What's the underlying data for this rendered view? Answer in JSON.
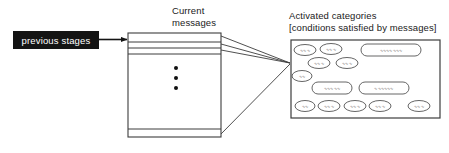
{
  "diagram": {
    "title_current_messages": "Current\nmessages",
    "current_messages_line1": "Current",
    "current_messages_line2": "messages",
    "activated_line1": "Activated categories",
    "activated_line2": "[conditions satisfied by messages]",
    "previous_stages_label": "previous stages",
    "ellipsis_label": "vertical-ellipsis",
    "colors": {
      "ink": "#1a1a1a",
      "stroke": "#3c3c3c",
      "black_box_fill": "#141414",
      "black_box_text": "#ffffff",
      "scribble": "#6a6a6a",
      "background": "#ffffff"
    },
    "message_rows": [
      {
        "id": "row-1",
        "y": 33,
        "height": 9
      },
      {
        "id": "row-2",
        "y": 42,
        "height": 6
      },
      {
        "id": "row-3",
        "y": 48,
        "height": 6
      },
      {
        "id": "row-body",
        "y": 54,
        "height": 75
      },
      {
        "id": "row-last",
        "y": 129,
        "height": 8
      }
    ],
    "categories": [
      {
        "id": "cat-1",
        "cx": 305,
        "cy": 50,
        "rx": 11,
        "ry": 5.5,
        "text": "∿∿∿"
      },
      {
        "id": "cat-2",
        "cx": 331,
        "cy": 49,
        "rx": 11,
        "ry": 5.5,
        "text": "∿∿∿"
      },
      {
        "id": "cat-3",
        "cx": 391,
        "cy": 50,
        "rx": 30,
        "ry": 6,
        "text": "∿∿∿∿∿∿∿"
      },
      {
        "id": "cat-4",
        "cx": 319,
        "cy": 63,
        "rx": 11,
        "ry": 5.5,
        "text": "∿∿∿"
      },
      {
        "id": "cat-5",
        "cx": 347,
        "cy": 63,
        "rx": 11,
        "ry": 5.5,
        "text": "∿∿∿"
      },
      {
        "id": "cat-6",
        "cx": 302,
        "cy": 76,
        "rx": 10,
        "ry": 5.5,
        "text": "∿∿"
      },
      {
        "id": "cat-7",
        "cx": 332,
        "cy": 88,
        "rx": 20,
        "ry": 6,
        "text": "∿∿∿∿∿"
      },
      {
        "id": "cat-8",
        "cx": 384,
        "cy": 88,
        "rx": 25,
        "ry": 6,
        "text": "∿∿∿∿∿∿"
      },
      {
        "id": "cat-9",
        "cx": 305,
        "cy": 106,
        "rx": 10,
        "ry": 5.5,
        "text": "∿∿"
      },
      {
        "id": "cat-10",
        "cx": 329,
        "cy": 106,
        "rx": 11,
        "ry": 5.5,
        "text": "∿∿∿"
      },
      {
        "id": "cat-11",
        "cx": 355,
        "cy": 106,
        "rx": 11,
        "ry": 5.5,
        "text": "∿∿∿"
      },
      {
        "id": "cat-12",
        "cx": 380,
        "cy": 106,
        "rx": 11,
        "ry": 5.5,
        "text": "∿∿∿"
      },
      {
        "id": "cat-13",
        "cx": 419,
        "cy": 106,
        "rx": 11,
        "ry": 5.5,
        "text": "∿∿∿"
      }
    ]
  }
}
